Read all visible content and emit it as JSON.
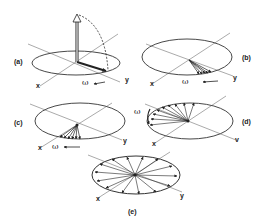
{
  "figure": {
    "panels": [
      {
        "id": "a",
        "label": "(a)",
        "axes": {
          "x": "x",
          "y": "y"
        },
        "rotation": "ω",
        "description": "Magnetization vector tipped from z-axis into transverse plane along y"
      },
      {
        "id": "b",
        "label": "(b)",
        "axes": {
          "x": "x",
          "y": "y"
        },
        "rotation": "ω",
        "description": "Spins begin to dephase, small fan near y-axis"
      },
      {
        "id": "c",
        "label": "(c)",
        "axes": {
          "x": "x",
          "y": "y"
        },
        "rotation": "ω",
        "description": "Further dephasing, wider fan of vectors"
      },
      {
        "id": "d",
        "label": "(d)",
        "axes": {
          "x": "x",
          "y": "v"
        },
        "rotation": "ω",
        "description": "Spins spread over half the plane"
      },
      {
        "id": "e",
        "label": "(e)",
        "axes": {
          "x": "x",
          "y": "y"
        },
        "rotation": "",
        "description": "Complete dephasing, vectors uniformly distributed"
      }
    ]
  }
}
